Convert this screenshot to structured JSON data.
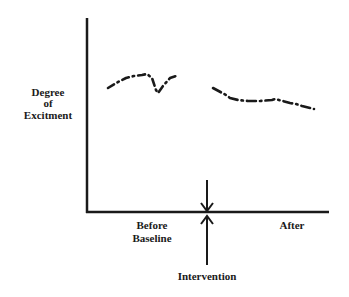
{
  "chart_data": {
    "type": "line",
    "title": "",
    "ylabel": [
      "Degree",
      "of",
      "Excitment"
    ],
    "xlabel": "",
    "x_regions": [
      {
        "label_lines": [
          "Before",
          "Baseline"
        ],
        "phase": "baseline"
      },
      {
        "label_lines": [
          "After"
        ],
        "phase": "after"
      }
    ],
    "annotation": {
      "label": "Intervention",
      "arrow": "up-and-down at phase boundary"
    },
    "series": [
      {
        "name": "Before (Baseline)",
        "style": "dash-dot",
        "points": [
          [
            108,
            88
          ],
          [
            118,
            82
          ],
          [
            126,
            78
          ],
          [
            134,
            76
          ],
          [
            142,
            75
          ],
          [
            147,
            74
          ],
          [
            152,
            78
          ],
          [
            156,
            90
          ],
          [
            158,
            93
          ],
          [
            163,
            86
          ],
          [
            170,
            78
          ],
          [
            179,
            75
          ]
        ]
      },
      {
        "name": "After",
        "style": "dash-dot",
        "points": [
          [
            213,
            88
          ],
          [
            226,
            95
          ],
          [
            230,
            98
          ],
          [
            238,
            100
          ],
          [
            248,
            101
          ],
          [
            252,
            101
          ],
          [
            260,
            101
          ],
          [
            272,
            100
          ],
          [
            275,
            99
          ],
          [
            283,
            101
          ],
          [
            290,
            103
          ],
          [
            296,
            104
          ],
          [
            302,
            106
          ],
          [
            314,
            109
          ]
        ]
      }
    ],
    "axes": {
      "x_ticks": [],
      "y_ticks": [],
      "grid": false,
      "legend": "none"
    }
  },
  "labels": {
    "y_axis": [
      "Degree",
      "of",
      "Excitment"
    ],
    "before": [
      "Before",
      "Baseline"
    ],
    "after": "After",
    "intervention": "Intervention"
  },
  "colors": {
    "ink": "#1a1a1a",
    "background": "#ffffff"
  }
}
